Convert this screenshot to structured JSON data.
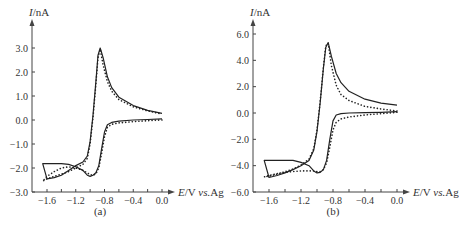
{
  "chart_data": [
    {
      "type": "line",
      "panel": "(a)",
      "title": "",
      "xlabel": "E/V vs.Ag",
      "ylabel": "I/nA",
      "xlim": [
        -1.7,
        0.05
      ],
      "ylim": [
        -3.0,
        3.4
      ],
      "xticks": [
        -1.6,
        -1.2,
        -0.8,
        -0.4,
        0.0
      ],
      "xtick_labels": [
        "-1.6",
        "-1.2",
        "-0.8",
        "-0.4",
        "0.0"
      ],
      "yticks": [
        3.0,
        2.0,
        1.0,
        0.0,
        -1.0,
        -2.0,
        -3.0
      ],
      "ytick_labels": [
        "3.0",
        "2.0",
        "1.0",
        "0.0",
        "-1.0",
        "-2.0",
        "-3.0"
      ],
      "grid": false,
      "legend": null,
      "series": [
        {
          "name": "experimental (solid)",
          "style": "solid",
          "x": [
            0.0,
            -0.2,
            -0.4,
            -0.6,
            -0.7,
            -0.76,
            -0.8,
            -0.84,
            -0.88,
            -0.92,
            -0.96,
            -1.0,
            -1.04,
            -1.1,
            -1.2,
            -1.3,
            -1.4,
            -1.5,
            -1.6,
            -1.66,
            -1.6,
            -1.5,
            -1.4,
            -1.3,
            -1.2,
            -1.1,
            -1.04,
            -1.0,
            -0.96,
            -0.92,
            -0.89,
            -0.86,
            -0.82,
            -0.76,
            -0.7,
            -0.6,
            -0.4,
            -0.2,
            0.0
          ],
          "y": [
            0.05,
            0.02,
            0.0,
            -0.05,
            -0.1,
            -0.2,
            -0.5,
            -1.2,
            -1.9,
            -2.2,
            -2.3,
            -2.35,
            -2.3,
            -2.1,
            -1.95,
            -1.85,
            -1.82,
            -1.82,
            -1.82,
            -1.82,
            -2.45,
            -2.4,
            -2.3,
            -2.1,
            -1.9,
            -1.75,
            -1.5,
            -0.9,
            0.2,
            1.6,
            2.7,
            3.0,
            2.6,
            1.8,
            1.35,
            0.95,
            0.6,
            0.4,
            0.28
          ]
        },
        {
          "name": "simulated (dotted)",
          "style": "dotted",
          "x": [
            0.0,
            -0.2,
            -0.4,
            -0.6,
            -0.7,
            -0.76,
            -0.8,
            -0.84,
            -0.88,
            -0.92,
            -0.96,
            -1.0,
            -1.04,
            -1.1,
            -1.2,
            -1.3,
            -1.4,
            -1.5,
            -1.6,
            -1.66,
            -1.6,
            -1.5,
            -1.4,
            -1.3,
            -1.2,
            -1.1,
            -1.04,
            -1.0,
            -0.96,
            -0.92,
            -0.89,
            -0.86,
            -0.82,
            -0.76,
            -0.7,
            -0.6,
            -0.4,
            -0.2,
            0.0
          ],
          "y": [
            0.0,
            -0.03,
            -0.07,
            -0.12,
            -0.18,
            -0.3,
            -0.7,
            -1.4,
            -2.0,
            -2.25,
            -2.3,
            -2.28,
            -2.2,
            -2.1,
            -2.0,
            -1.95,
            -2.0,
            -2.15,
            -2.35,
            -2.55,
            -2.45,
            -2.35,
            -2.25,
            -2.15,
            -2.0,
            -1.85,
            -1.6,
            -1.0,
            0.1,
            1.5,
            2.6,
            2.95,
            2.3,
            1.6,
            1.2,
            0.85,
            0.55,
            0.38,
            0.25
          ]
        }
      ]
    },
    {
      "type": "line",
      "panel": "(b)",
      "title": "",
      "xlabel": "E/V vs.Ag",
      "ylabel": "I/nA",
      "xlim": [
        -1.7,
        0.05
      ],
      "ylim": [
        -6.0,
        6.5
      ],
      "xticks": [
        -1.6,
        -1.2,
        -0.8,
        -0.4,
        0.0
      ],
      "xtick_labels": [
        "-1.6",
        "-1.2",
        "-0.8",
        "-0.4",
        "0.0"
      ],
      "yticks": [
        6.0,
        4.0,
        2.0,
        0.0,
        -2.0,
        -4.0,
        -6.0
      ],
      "ytick_labels": [
        "6.0",
        "4.0",
        "2.0",
        "0.0",
        "-2.0",
        "-4.0",
        "-6.0"
      ],
      "grid": false,
      "legend": null,
      "series": [
        {
          "name": "experimental (solid)",
          "style": "solid",
          "x": [
            0.0,
            -0.2,
            -0.4,
            -0.6,
            -0.7,
            -0.76,
            -0.8,
            -0.84,
            -0.88,
            -0.92,
            -0.96,
            -1.0,
            -1.04,
            -1.1,
            -1.2,
            -1.3,
            -1.4,
            -1.5,
            -1.6,
            -1.66,
            -1.6,
            -1.5,
            -1.4,
            -1.3,
            -1.2,
            -1.1,
            -1.04,
            -1.0,
            -0.96,
            -0.92,
            -0.89,
            -0.86,
            -0.82,
            -0.76,
            -0.7,
            -0.6,
            -0.4,
            -0.2,
            0.0
          ],
          "y": [
            0.1,
            0.05,
            0.02,
            0.0,
            -0.05,
            -0.15,
            -0.6,
            -2.0,
            -3.6,
            -4.3,
            -4.5,
            -4.55,
            -4.4,
            -4.0,
            -3.75,
            -3.6,
            -3.6,
            -3.6,
            -3.6,
            -3.6,
            -4.9,
            -4.75,
            -4.55,
            -4.3,
            -4.0,
            -3.6,
            -2.8,
            -1.4,
            0.8,
            3.4,
            5.0,
            5.35,
            4.3,
            3.0,
            2.3,
            1.65,
            1.05,
            0.75,
            0.6
          ]
        },
        {
          "name": "simulated (dotted)",
          "style": "dotted",
          "x": [
            0.0,
            -0.2,
            -0.4,
            -0.6,
            -0.7,
            -0.76,
            -0.8,
            -0.84,
            -0.88,
            -0.92,
            -0.96,
            -1.0,
            -1.04,
            -1.1,
            -1.2,
            -1.3,
            -1.4,
            -1.5,
            -1.6,
            -1.66,
            -1.6,
            -1.5,
            -1.4,
            -1.3,
            -1.2,
            -1.1,
            -1.04,
            -1.0,
            -0.96,
            -0.92,
            -0.89,
            -0.86,
            -0.82,
            -0.76,
            -0.7,
            -0.6,
            -0.4,
            -0.2,
            0.0
          ],
          "y": [
            0.05,
            -0.05,
            -0.15,
            -0.3,
            -0.45,
            -0.7,
            -1.3,
            -2.6,
            -3.8,
            -4.3,
            -4.45,
            -4.45,
            -4.4,
            -4.4,
            -4.4,
            -4.45,
            -4.5,
            -4.6,
            -4.75,
            -4.85,
            -4.8,
            -4.65,
            -4.45,
            -4.25,
            -3.95,
            -3.5,
            -2.7,
            -1.3,
            0.9,
            3.5,
            5.1,
            5.3,
            3.6,
            2.1,
            1.4,
            0.95,
            0.5,
            0.3,
            0.15
          ]
        }
      ]
    }
  ],
  "panels": [
    {
      "label": "(a)",
      "ylabel_italic": "I",
      "ylabel_unit": "/nA",
      "xlabel_italic": "E",
      "xlabel_mid": "/V ",
      "xlabel_vs": "vs.",
      "xlabel_ref": "Ag"
    },
    {
      "label": "(b)",
      "ylabel_italic": "I",
      "ylabel_unit": "/nA",
      "xlabel_italic": "E",
      "xlabel_mid": "/V ",
      "xlabel_vs": "vs.",
      "xlabel_ref": "Ag"
    }
  ],
  "colors": {
    "line": "#222222",
    "axis": "#444444",
    "text": "#333333"
  }
}
